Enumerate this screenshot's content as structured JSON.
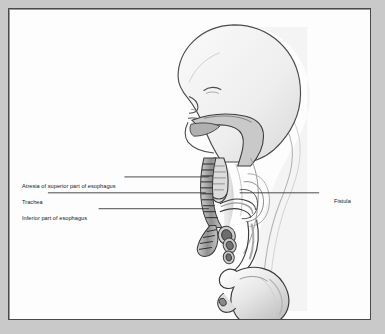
{
  "figure": {
    "frame_color": "#4a4a4a",
    "background_color": "#c9c9c9",
    "canvas_color": "#fdfdfd",
    "labels": [
      {
        "id": "atresia",
        "text": "Atresia of superior part of esophagus",
        "side": "left"
      },
      {
        "id": "trachea",
        "text": "Trachea",
        "side": "left"
      },
      {
        "id": "inferior",
        "text": "Inferior part of esophagus",
        "side": "left"
      },
      {
        "id": "fistula",
        "text": "Fistula",
        "side": "right"
      }
    ],
    "leader_lines": [
      {
        "id": "leader-atresia",
        "x1": 124,
        "y1": 177,
        "x2": 209,
        "y2": 177
      },
      {
        "id": "leader-trachea",
        "x1": 47,
        "y1": 193,
        "x2": 206,
        "y2": 193
      },
      {
        "id": "leader-inferior",
        "x1": 98,
        "y1": 209,
        "x2": 209,
        "y2": 209
      },
      {
        "id": "leader-fistula",
        "x1": 240,
        "y1": 193,
        "x2": 320,
        "y2": 193
      }
    ],
    "anatomy": {
      "view": "sagittal section of fetal head, neck and upper abdomen",
      "structures": [
        "cranium",
        "closed eye",
        "nose",
        "mouth",
        "tongue",
        "oral cavity",
        "pharynx",
        "atretic upper esophageal pouch",
        "trachea with cartilage rings",
        "tracheoesophageal fistula",
        "bronchi",
        "inferior esophagus",
        "stomach",
        "duodenum"
      ],
      "fill_light": "#f2f2f2",
      "fill_mid": "#d2d2d2",
      "fill_dark": "#9e9e9e",
      "outline": "#3a3a3a"
    }
  }
}
